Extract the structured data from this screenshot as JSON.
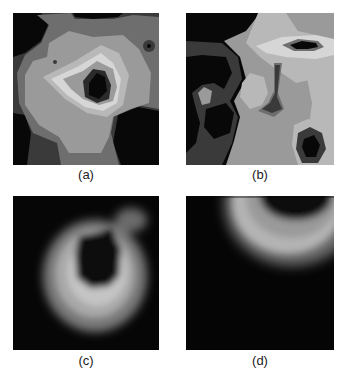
{
  "figure": {
    "panels": [
      {
        "id": "a",
        "label": "(a)",
        "type": "contour-map",
        "colormap": "grayscale"
      },
      {
        "id": "b",
        "label": "(b)",
        "type": "contour-map",
        "colormap": "grayscale"
      },
      {
        "id": "c",
        "label": "(c)",
        "type": "smoothed-intensity-map",
        "colormap": "grayscale"
      },
      {
        "id": "d",
        "label": "(d)",
        "type": "smoothed-intensity-map",
        "colormap": "grayscale"
      }
    ],
    "colors": {
      "level0": "#080808",
      "level1": "#3a3a3a",
      "level2": "#6e6e6e",
      "level3": "#9a9a9a",
      "level4": "#b8b8b8",
      "level5": "#d6d6d6",
      "background": "#ffffff"
    }
  }
}
